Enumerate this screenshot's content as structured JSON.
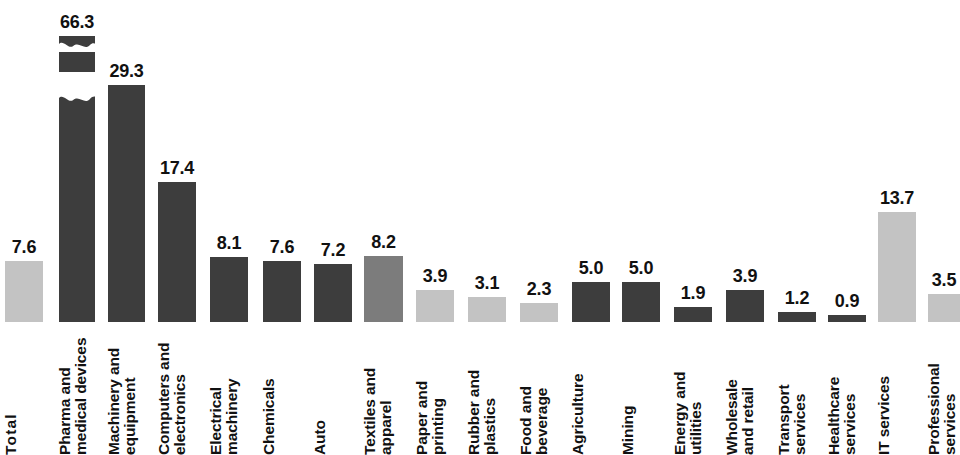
{
  "chart_data": {
    "type": "bar",
    "title": "",
    "subtitle": "",
    "xlabel": "",
    "ylabel": "",
    "grid": false,
    "legend": "none",
    "axis_break": {
      "present": true,
      "on_category": "Pharma and medical devices",
      "note": "Bar truncated with zigzag break; true value 66.3"
    },
    "ylim": [
      0,
      30
    ],
    "px_per_unit": 8.08,
    "baseline_y": 322,
    "categories": [
      "Total",
      "Pharma and medical devices",
      "Machinery and equipment",
      "Computers and electronics",
      "Electrical machinery",
      "Chemicals",
      "Auto",
      "Textiles and apparel",
      "Paper and printing",
      "Rubber and plastics",
      "Food and beverage",
      "Agriculture",
      "Mining",
      "Energy and utilities",
      "Wholesale and retail",
      "Transport services",
      "Healthcare services",
      "IT services",
      "Professional services"
    ],
    "values": [
      7.6,
      66.3,
      29.3,
      17.4,
      8.1,
      7.6,
      7.2,
      8.2,
      3.9,
      3.1,
      2.3,
      5.0,
      5.0,
      1.9,
      3.9,
      1.2,
      0.9,
      13.7,
      3.5
    ],
    "value_labels": [
      "7.6",
      "66.3",
      "29.3",
      "17.4",
      "8.1",
      "7.6",
      "7.2",
      "8.2",
      "3.9",
      "3.1",
      "2.3",
      "5.0",
      "5.0",
      "1.9",
      "3.9",
      "1.2",
      "0.9",
      "13.7",
      "3.5"
    ],
    "colors": {
      "dark": "#3d3d3d",
      "mid": "#7c7c7c",
      "light": "#c3c3c3",
      "background": "#ffffff",
      "text": "#111111"
    },
    "bar_tones": [
      "light",
      "dark",
      "dark",
      "dark",
      "dark",
      "dark",
      "dark",
      "mid",
      "light",
      "light",
      "light",
      "dark",
      "dark",
      "dark",
      "dark",
      "dark",
      "dark",
      "light",
      "light"
    ]
  },
  "bars": [
    {
      "label_lines": [
        "Total"
      ],
      "value": "7.6",
      "tone": "light",
      "x": 5,
      "w": 38,
      "bar_h": 61,
      "truncated": false,
      "emphasis": true
    },
    {
      "label_lines": [
        "Pharma and",
        "medical devices"
      ],
      "value": "66.3",
      "tone": "dark",
      "x": 59,
      "w": 36,
      "bar_h": 296,
      "truncated": true,
      "emphasis": false
    },
    {
      "label_lines": [
        "Machinery and",
        "equipment"
      ],
      "value": "29.3",
      "tone": "dark",
      "x": 108,
      "w": 37,
      "bar_h": 237,
      "truncated": false,
      "emphasis": false
    },
    {
      "label_lines": [
        "Computers and",
        "electronics"
      ],
      "value": "17.4",
      "tone": "dark",
      "x": 158,
      "w": 38,
      "bar_h": 140,
      "truncated": false,
      "emphasis": false
    },
    {
      "label_lines": [
        "Electrical",
        "machinery"
      ],
      "value": "8.1",
      "tone": "dark",
      "x": 210,
      "w": 38,
      "bar_h": 65,
      "truncated": false,
      "emphasis": false
    },
    {
      "label_lines": [
        "Chemicals"
      ],
      "value": "7.6",
      "tone": "dark",
      "x": 263,
      "w": 38,
      "bar_h": 61,
      "truncated": false,
      "emphasis": false
    },
    {
      "label_lines": [
        "Auto"
      ],
      "value": "7.2",
      "tone": "dark",
      "x": 314,
      "w": 38,
      "bar_h": 58,
      "truncated": false,
      "emphasis": false
    },
    {
      "label_lines": [
        "Textiles and",
        "apparel"
      ],
      "value": "8.2",
      "tone": "mid",
      "x": 364,
      "w": 39,
      "bar_h": 66,
      "truncated": false,
      "emphasis": false
    },
    {
      "label_lines": [
        "Paper and",
        "printing"
      ],
      "value": "3.9",
      "tone": "light",
      "x": 416,
      "w": 38,
      "bar_h": 32,
      "truncated": false,
      "emphasis": false
    },
    {
      "label_lines": [
        "Rubber and",
        "plastics"
      ],
      "value": "3.1",
      "tone": "light",
      "x": 468,
      "w": 38,
      "bar_h": 25,
      "truncated": false,
      "emphasis": false
    },
    {
      "label_lines": [
        "Food and",
        "beverage"
      ],
      "value": "2.3",
      "tone": "light",
      "x": 520,
      "w": 38,
      "bar_h": 19,
      "truncated": false,
      "emphasis": false
    },
    {
      "label_lines": [
        "Agriculture"
      ],
      "value": "5.0",
      "tone": "dark",
      "x": 572,
      "w": 38,
      "bar_h": 40,
      "truncated": false,
      "emphasis": false
    },
    {
      "label_lines": [
        "Mining"
      ],
      "value": "5.0",
      "tone": "dark",
      "x": 622,
      "w": 38,
      "bar_h": 40,
      "truncated": false,
      "emphasis": false
    },
    {
      "label_lines": [
        "Energy and",
        "utilities"
      ],
      "value": "1.9",
      "tone": "dark",
      "x": 674,
      "w": 38,
      "bar_h": 15,
      "truncated": false,
      "emphasis": false
    },
    {
      "label_lines": [
        "Wholesale",
        "and retail"
      ],
      "value": "3.9",
      "tone": "dark",
      "x": 726,
      "w": 38,
      "bar_h": 32,
      "truncated": false,
      "emphasis": false
    },
    {
      "label_lines": [
        "Transport",
        "services"
      ],
      "value": "1.2",
      "tone": "dark",
      "x": 778,
      "w": 38,
      "bar_h": 10,
      "truncated": false,
      "emphasis": false
    },
    {
      "label_lines": [
        "Healthcare",
        "services"
      ],
      "value": "0.9",
      "tone": "dark",
      "x": 828,
      "w": 38,
      "bar_h": 7,
      "truncated": false,
      "emphasis": false
    },
    {
      "label_lines": [
        "IT services"
      ],
      "value": "13.7",
      "tone": "light",
      "x": 878,
      "w": 38,
      "bar_h": 110,
      "truncated": false,
      "emphasis": false
    },
    {
      "label_lines": [
        "Professional",
        "services"
      ],
      "value": "3.5",
      "tone": "light",
      "x": 928,
      "w": 32,
      "bar_h": 28,
      "truncated": false,
      "emphasis": false
    }
  ]
}
